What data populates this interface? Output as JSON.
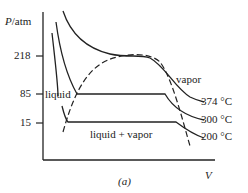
{
  "diagram": {
    "caption": "(a)",
    "axes": {
      "y_label_var": "P",
      "y_label_unit": "/atm",
      "x_label": "V",
      "y_ticks": [
        {
          "label": "218",
          "value": 218
        },
        {
          "label": "85",
          "value": 85
        },
        {
          "label": "15",
          "value": 15
        }
      ]
    },
    "regions": {
      "liquid": "liquid",
      "vapor": "vapor",
      "coexistence": "liquid + vapor"
    },
    "isotherms": [
      {
        "label": "374 °C",
        "temperature_c": 374,
        "critical": true
      },
      {
        "label": "300 °C",
        "temperature_c": 300,
        "plateau_pressure_atm": 85
      },
      {
        "label": "200 °C",
        "temperature_c": 200,
        "plateau_pressure_atm": 15
      }
    ],
    "critical_point": {
      "pressure_atm": 218,
      "temperature_c": 374
    },
    "dome_style": "dashed",
    "colors": {
      "ink": "#222222",
      "background": "#ffffff"
    }
  }
}
